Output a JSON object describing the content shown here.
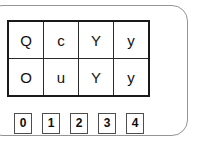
{
  "panel": {
    "shape": "rounded-rectangle",
    "border_color": "#959595",
    "background_color": "#ffffff"
  },
  "grid": {
    "border_color": "#1a1a1a",
    "rows": [
      [
        "Q",
        "c",
        "Y",
        "y"
      ],
      [
        "O",
        "u",
        "Y",
        "y"
      ]
    ]
  },
  "numbers": {
    "border_color": "#4d4d4d",
    "items": [
      "0",
      "1",
      "2",
      "3",
      "4"
    ]
  }
}
